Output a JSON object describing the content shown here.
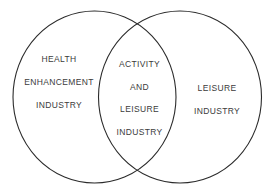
{
  "figure": {
    "type": "venn-diagram",
    "sets": 2,
    "background_color": "#ffffff",
    "stroke_color": "#2b2b2b",
    "text_color": "#3b3b3b"
  },
  "left_circle": {
    "name": "health-enhancement-industry",
    "lines": [
      "HEALTH",
      "ENHANCEMENT",
      "INDUSTRY"
    ]
  },
  "intersection": {
    "name": "activity-and-leisure-industry",
    "lines": [
      "ACTIVITY",
      "AND",
      "LEISURE",
      "INDUSTRY"
    ]
  },
  "right_circle": {
    "name": "leisure-industry",
    "lines": [
      "LEISURE",
      "INDUSTRY"
    ]
  }
}
